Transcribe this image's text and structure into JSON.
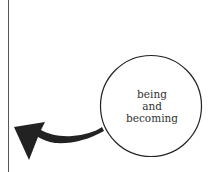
{
  "diagram": {
    "circle": {
      "lines": [
        "being",
        "and",
        "becoming"
      ],
      "stroke_color": "#222222"
    },
    "arrow": {
      "direction": "left",
      "fill_color": "#222222"
    },
    "divider": {
      "color": "#555555"
    }
  }
}
